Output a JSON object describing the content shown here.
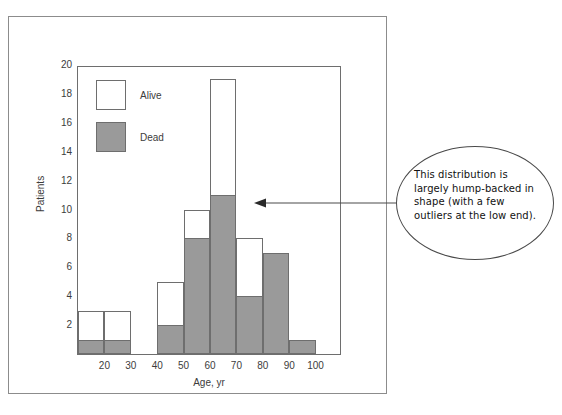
{
  "figure": {
    "frame_visible": true
  },
  "chart_data": {
    "type": "bar",
    "title": "",
    "subtitle": "",
    "xlabel": "Age, yr",
    "ylabel": "Patients",
    "xlim": [
      10,
      110
    ],
    "ylim": [
      0,
      20
    ],
    "xticks": [
      20,
      30,
      40,
      50,
      60,
      70,
      80,
      90,
      100
    ],
    "yticks": [
      2,
      4,
      6,
      8,
      10,
      12,
      14,
      16,
      18,
      20
    ],
    "grid": false,
    "legend_position": "upper-left",
    "bin_width": 10,
    "bin_starts": [
      10,
      20,
      30,
      40,
      50,
      60,
      70,
      80,
      90
    ],
    "bin_labels": [
      "10-20",
      "20-30",
      "30-40",
      "40-50",
      "50-60",
      "60-70",
      "70-80",
      "80-90",
      "90-100"
    ],
    "stacked": true,
    "series": [
      {
        "name": "Dead",
        "color": "#9a9a9a",
        "values": [
          1,
          1,
          0,
          2,
          8,
          11,
          4,
          7,
          1
        ]
      },
      {
        "name": "Alive",
        "color": "#ffffff",
        "values": [
          2,
          2,
          0,
          3,
          2,
          8,
          4,
          0,
          0
        ]
      }
    ],
    "totals": [
      3,
      3,
      0,
      5,
      10,
      19,
      8,
      7,
      1
    ],
    "annotations": [
      {
        "text": "This distribution is largely hump-backed in shape (with a few outliers at the low end).",
        "shape": "ellipse",
        "arrow": true,
        "points_to": [
          62,
          10
        ]
      }
    ]
  },
  "legend": {
    "items": [
      {
        "label": "Alive",
        "swatch": "white-square",
        "color": "#ffffff"
      },
      {
        "label": "Dead",
        "swatch": "gray-square",
        "color": "#9a9a9a"
      }
    ]
  },
  "axes": {
    "x_label": "Age, yr",
    "y_label": "Patients",
    "x_ticks": [
      "20",
      "30",
      "40",
      "50",
      "60",
      "70",
      "80",
      "90",
      "100"
    ],
    "y_ticks": [
      "2",
      "4",
      "6",
      "8",
      "10",
      "12",
      "14",
      "16",
      "18",
      "20"
    ]
  },
  "callout": {
    "text": "This distribution is largely hump-backed in shape (with a few outliers at the low end)."
  },
  "colors": {
    "dead_fill": "#9a9a9a",
    "alive_fill": "#ffffff",
    "stroke": "#6e6e6e",
    "frame": "#8c8c8c",
    "text": "#3c3c3c",
    "callout_stroke": "#4a4a4a"
  }
}
